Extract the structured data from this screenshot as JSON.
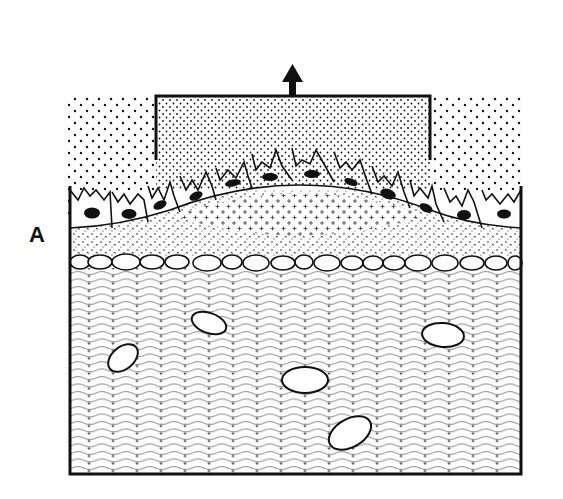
{
  "figure": {
    "panel_label": "A",
    "arrow": {
      "direction": "up",
      "x": 292,
      "y_top": 66,
      "y_bottom": 96
    },
    "bracket": {
      "x1": 156,
      "x2": 430,
      "y": 96,
      "depth_px": 65
    },
    "colors": {
      "ink": "#111111",
      "background": "#ffffff",
      "wave": "#777777"
    },
    "layers": [
      {
        "name": "secretion-zone",
        "pattern": "dots",
        "dense_in_bracket": true
      },
      {
        "name": "epithelial-layer",
        "cell_count": 15,
        "nucleus": "dark-oval"
      },
      {
        "name": "basement-layer",
        "pattern": "plus-dots"
      },
      {
        "name": "flattened-cell-row",
        "cell_count": 19
      },
      {
        "name": "connective-tissue",
        "pattern": "wavy-lines-with-plus",
        "embedded_cells": 5
      }
    ],
    "embedded_cells": [
      {
        "cx": 209,
        "cy": 323,
        "rx": 18,
        "ry": 10,
        "rot": 20
      },
      {
        "cx": 123,
        "cy": 358,
        "rx": 17,
        "ry": 11,
        "rot": -40
      },
      {
        "cx": 305,
        "cy": 380,
        "rx": 23,
        "ry": 13,
        "rot": 0
      },
      {
        "cx": 443,
        "cy": 335,
        "rx": 21,
        "ry": 12,
        "rot": 5
      },
      {
        "cx": 350,
        "cy": 433,
        "rx": 23,
        "ry": 14,
        "rot": -30
      }
    ]
  }
}
